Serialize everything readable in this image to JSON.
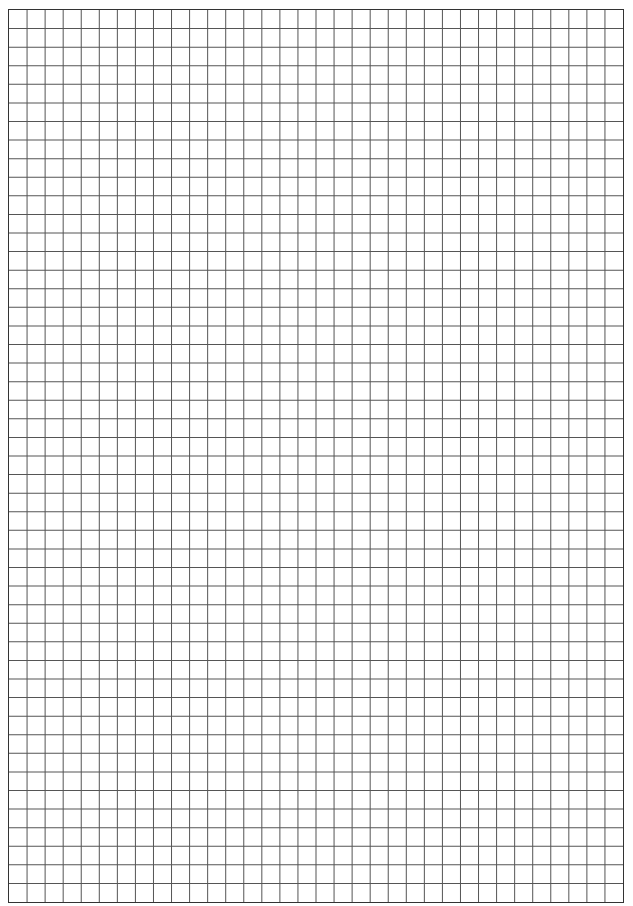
{
  "page": {
    "type": "grid-paper",
    "background_color": "#ffffff",
    "line_color": "#555555",
    "border_color": "#333333",
    "columns": 34,
    "rows": 48
  }
}
